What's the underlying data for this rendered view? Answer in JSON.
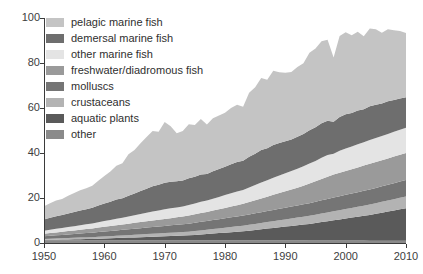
{
  "chart_data": {
    "type": "area",
    "title": "",
    "subtitle": "",
    "xlabel": "",
    "ylabel": "",
    "xlim": [
      1950,
      2010
    ],
    "ylim": [
      0,
      100
    ],
    "grid": false,
    "stacked": true,
    "legend_position": "top-left",
    "x_ticks": [
      "1950",
      "1960",
      "1970",
      "1980",
      "1990",
      "2000",
      "2010"
    ],
    "x_tick_values": [
      1950,
      1960,
      1970,
      1980,
      1990,
      2000,
      2010
    ],
    "y_ticks": [
      "0",
      "20",
      "40",
      "60",
      "80",
      "100"
    ],
    "y_tick_values": [
      0,
      20,
      40,
      60,
      80,
      100
    ],
    "x": [
      1950,
      1951,
      1952,
      1953,
      1954,
      1955,
      1956,
      1957,
      1958,
      1959,
      1960,
      1961,
      1962,
      1963,
      1964,
      1965,
      1966,
      1967,
      1968,
      1969,
      1970,
      1971,
      1972,
      1973,
      1974,
      1975,
      1976,
      1977,
      1978,
      1979,
      1980,
      1981,
      1982,
      1983,
      1984,
      1985,
      1986,
      1987,
      1988,
      1989,
      1990,
      1991,
      1992,
      1993,
      1994,
      1995,
      1996,
      1997,
      1998,
      1999,
      2000,
      2001,
      2002,
      2003,
      2004,
      2005,
      2006,
      2007,
      2008,
      2009,
      2010
    ],
    "stack_order_bottom_to_top": [
      "other",
      "aquatic plants",
      "crustaceans",
      "molluscs",
      "freshwater/diadromous fish",
      "other marine fish",
      "demersal marine fish",
      "pelagic marine fish"
    ],
    "series": [
      {
        "name": "pelagic marine fish",
        "color": "#c4c4c4",
        "values": [
          5.8,
          6.5,
          7.0,
          7.2,
          7.9,
          8.4,
          9.0,
          9.3,
          9.8,
          11.0,
          12.2,
          13.4,
          15.0,
          15.6,
          18.5,
          19.4,
          21.2,
          23.0,
          24.6,
          23.6,
          27.0,
          24.6,
          21.4,
          22.0,
          24.0,
          23.0,
          24.6,
          22.0,
          23.5,
          23.8,
          24.0,
          25.0,
          25.5,
          24.0,
          28.5,
          29.5,
          32.0,
          30.5,
          33.0,
          31.5,
          30.5,
          30.0,
          31.0,
          31.5,
          34.5,
          35.0,
          36.5,
          36.0,
          28.5,
          36.0,
          36.5,
          34.5,
          35.0,
          32.5,
          34.5,
          33.5,
          31.5,
          32.0,
          31.0,
          30.0,
          28.5
        ]
      },
      {
        "name": "demersal marine fish",
        "color": "#6e6e6e",
        "values": [
          5.0,
          5.3,
          5.6,
          5.7,
          6.0,
          6.3,
          6.6,
          6.7,
          7.0,
          7.4,
          7.8,
          8.1,
          8.5,
          8.6,
          9.2,
          9.6,
          10.2,
          10.7,
          11.2,
          11.4,
          11.8,
          11.8,
          11.6,
          11.5,
          11.9,
          11.8,
          12.2,
          11.8,
          12.2,
          12.4,
          12.6,
          12.9,
          13.1,
          13.0,
          13.6,
          13.9,
          14.4,
          14.2,
          14.6,
          14.4,
          14.2,
          14.0,
          14.2,
          14.3,
          14.8,
          15.0,
          15.3,
          15.2,
          14.2,
          15.0,
          15.2,
          14.9,
          15.0,
          14.6,
          15.0,
          14.8,
          14.4,
          14.5,
          14.2,
          13.9,
          13.6
        ]
      },
      {
        "name": "other marine fish",
        "color": "#e4e4e4",
        "values": [
          1.4,
          1.5,
          1.6,
          1.7,
          1.8,
          1.9,
          2.0,
          2.1,
          2.2,
          2.4,
          2.6,
          2.7,
          2.9,
          3.0,
          3.2,
          3.4,
          3.6,
          3.8,
          4.0,
          4.1,
          4.3,
          4.4,
          4.4,
          4.5,
          4.7,
          4.8,
          5.0,
          5.1,
          5.3,
          5.5,
          5.7,
          5.9,
          6.1,
          6.2,
          6.5,
          6.8,
          7.1,
          7.3,
          7.6,
          7.8,
          8.0,
          8.2,
          8.4,
          8.6,
          8.9,
          9.1,
          9.4,
          9.6,
          9.3,
          9.8,
          10.0,
          10.1,
          10.3,
          10.4,
          10.6,
          10.7,
          10.8,
          10.9,
          11.0,
          11.1,
          11.2
        ]
      },
      {
        "name": "freshwater/diadromous fish",
        "color": "#9a9a9a",
        "values": [
          1.1,
          1.2,
          1.3,
          1.4,
          1.5,
          1.6,
          1.7,
          1.8,
          1.9,
          2.0,
          2.1,
          2.2,
          2.3,
          2.4,
          2.5,
          2.6,
          2.7,
          2.8,
          2.9,
          3.0,
          3.1,
          3.2,
          3.3,
          3.4,
          3.6,
          3.8,
          3.9,
          4.0,
          4.2,
          4.4,
          4.6,
          4.8,
          5.0,
          5.2,
          5.5,
          5.8,
          6.1,
          6.4,
          6.7,
          7.0,
          7.3,
          7.6,
          7.9,
          8.3,
          8.7,
          9.1,
          9.5,
          9.9,
          10.2,
          10.4,
          10.6,
          10.8,
          11.0,
          11.2,
          11.4,
          11.5,
          11.6,
          11.7,
          11.8,
          11.9,
          12.0
        ]
      },
      {
        "name": "molluscs",
        "color": "#757575",
        "values": [
          1.2,
          1.3,
          1.4,
          1.5,
          1.6,
          1.7,
          1.8,
          1.9,
          2.0,
          2.1,
          2.2,
          2.3,
          2.4,
          2.5,
          2.6,
          2.7,
          2.8,
          2.9,
          3.0,
          3.1,
          3.2,
          3.3,
          3.4,
          3.5,
          3.6,
          3.7,
          3.8,
          3.9,
          4.0,
          4.1,
          4.2,
          4.3,
          4.4,
          4.5,
          4.6,
          4.7,
          4.8,
          4.9,
          5.0,
          5.1,
          5.2,
          5.3,
          5.4,
          5.5,
          5.6,
          5.7,
          5.9,
          6.0,
          6.1,
          6.2,
          6.3,
          6.4,
          6.5,
          6.6,
          6.7,
          6.8,
          6.9,
          7.0,
          7.1,
          7.2,
          7.3
        ]
      },
      {
        "name": "crustaceans",
        "color": "#b3b3b3",
        "values": [
          0.4,
          0.45,
          0.5,
          0.55,
          0.6,
          0.65,
          0.7,
          0.75,
          0.8,
          0.85,
          0.9,
          0.95,
          1.0,
          1.05,
          1.1,
          1.15,
          1.2,
          1.25,
          1.3,
          1.35,
          1.4,
          1.45,
          1.5,
          1.55,
          1.6,
          1.7,
          1.8,
          1.9,
          2.0,
          2.1,
          2.2,
          2.3,
          2.4,
          2.5,
          2.6,
          2.7,
          2.8,
          2.9,
          3.0,
          3.1,
          3.2,
          3.3,
          3.4,
          3.5,
          3.6,
          3.7,
          3.8,
          3.9,
          4.0,
          4.1,
          4.2,
          4.3,
          4.4,
          4.5,
          4.6,
          4.7,
          4.8,
          4.9,
          5.0,
          5.1,
          5.2
        ]
      },
      {
        "name": "aquatic plants",
        "color": "#5a5a5a",
        "values": [
          0.2,
          0.25,
          0.3,
          0.35,
          0.4,
          0.45,
          0.5,
          0.55,
          0.6,
          0.7,
          0.8,
          0.9,
          1.0,
          1.1,
          1.2,
          1.3,
          1.4,
          1.5,
          1.6,
          1.7,
          1.8,
          1.9,
          2.0,
          2.1,
          2.2,
          2.4,
          2.6,
          2.8,
          3.0,
          3.2,
          3.4,
          3.6,
          3.8,
          4.0,
          4.3,
          4.6,
          4.9,
          5.2,
          5.5,
          5.8,
          6.1,
          6.4,
          6.7,
          7.0,
          7.4,
          7.8,
          8.2,
          8.6,
          9.0,
          9.4,
          9.8,
          10.2,
          10.6,
          11.0,
          11.5,
          12.0,
          12.5,
          13.0,
          13.5,
          14.0,
          14.5
        ]
      },
      {
        "name": "other",
        "color": "#8a8a8a",
        "values": [
          1.2,
          1.2,
          1.2,
          1.2,
          1.2,
          1.2,
          1.2,
          1.2,
          1.2,
          1.2,
          1.2,
          1.2,
          1.2,
          1.2,
          1.2,
          1.2,
          1.2,
          1.2,
          1.2,
          1.2,
          1.2,
          1.2,
          1.2,
          1.2,
          1.2,
          1.2,
          1.2,
          1.2,
          1.2,
          1.2,
          1.2,
          1.2,
          1.2,
          1.2,
          1.2,
          1.2,
          1.2,
          1.2,
          1.2,
          1.2,
          1.2,
          1.2,
          1.2,
          1.2,
          1.1,
          1.1,
          1.1,
          1.1,
          1.1,
          1.1,
          1.1,
          1.1,
          1.1,
          1.1,
          1.0,
          1.0,
          1.0,
          1.0,
          1.0,
          1.0,
          1.0
        ]
      }
    ]
  },
  "legend": {
    "items": [
      {
        "label": "pelagic marine fish",
        "color": "#c4c4c4"
      },
      {
        "label": "demersal marine fish",
        "color": "#6e6e6e"
      },
      {
        "label": "other marine fish",
        "color": "#e4e4e4"
      },
      {
        "label": "freshwater/diadromous fish",
        "color": "#9a9a9a"
      },
      {
        "label": "molluscs",
        "color": "#757575"
      },
      {
        "label": "crustaceans",
        "color": "#b3b3b3"
      },
      {
        "label": "aquatic plants",
        "color": "#5a5a5a"
      },
      {
        "label": "other",
        "color": "#8a8a8a"
      }
    ]
  },
  "axes": {
    "axis_color": "#3b3b3b",
    "tick_text_color": "#3d3d3d"
  }
}
